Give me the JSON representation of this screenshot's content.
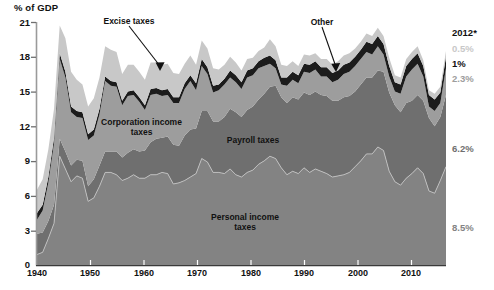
{
  "chart_data": {
    "type": "area",
    "title": "",
    "ylabel": "% of GDP",
    "xlabel": "",
    "xlim": [
      1940,
      2012
    ],
    "ylim": [
      0,
      21
    ],
    "yticks": [
      0,
      3,
      6,
      9,
      12,
      15,
      18,
      21
    ],
    "xticks": [
      1940,
      1950,
      1960,
      1970,
      1980,
      1990,
      2000,
      2010
    ],
    "grid": false,
    "legend": "inline-annotations",
    "stacked": true,
    "x": [
      1940,
      1941,
      1942,
      1943,
      1944,
      1945,
      1946,
      1947,
      1948,
      1949,
      1950,
      1951,
      1952,
      1953,
      1954,
      1955,
      1956,
      1957,
      1958,
      1959,
      1960,
      1961,
      1962,
      1963,
      1964,
      1965,
      1966,
      1967,
      1968,
      1969,
      1970,
      1971,
      1972,
      1973,
      1974,
      1975,
      1976,
      1977,
      1978,
      1979,
      1980,
      1981,
      1982,
      1983,
      1984,
      1985,
      1986,
      1987,
      1988,
      1989,
      1990,
      1991,
      1992,
      1993,
      1994,
      1995,
      1996,
      1997,
      1998,
      1999,
      2000,
      2001,
      2002,
      2003,
      2004,
      2005,
      2006,
      2007,
      2008,
      2009,
      2010,
      2011,
      2012
    ],
    "series": [
      {
        "name": "Personal income taxes",
        "label": "Personal income\ntaxes",
        "color": "#838383",
        "end_value": "8.5%",
        "values": [
          0.9,
          1.1,
          2.3,
          3.6,
          9.4,
          8.3,
          7.2,
          7.7,
          7.5,
          5.5,
          5.8,
          6.8,
          8.0,
          8.0,
          7.8,
          7.3,
          7.5,
          7.8,
          7.5,
          7.5,
          7.8,
          7.8,
          8.0,
          7.9,
          7.0,
          7.1,
          7.3,
          7.6,
          7.9,
          9.2,
          8.9,
          8.0,
          8.0,
          7.9,
          8.3,
          7.8,
          7.6,
          8.0,
          8.2,
          8.7,
          9.0,
          9.4,
          9.2,
          8.4,
          7.8,
          8.1,
          7.9,
          8.4,
          8.0,
          8.3,
          8.1,
          7.9,
          7.6,
          7.7,
          7.8,
          8.0,
          8.5,
          9.0,
          9.6,
          9.6,
          10.2,
          9.9,
          8.1,
          7.2,
          6.9,
          7.5,
          7.9,
          8.4,
          7.9,
          6.4,
          6.2,
          7.3,
          8.5
        ]
      },
      {
        "name": "Payroll taxes",
        "label": "Payroll taxes",
        "color": "#6f6f6f",
        "end_value": "6.2%",
        "values": [
          1.8,
          1.7,
          1.5,
          1.6,
          1.5,
          1.5,
          1.4,
          1.4,
          1.5,
          1.3,
          1.6,
          1.8,
          1.8,
          1.8,
          2.0,
          2.0,
          2.2,
          2.2,
          2.3,
          2.4,
          2.8,
          3.1,
          3.0,
          3.2,
          3.4,
          3.2,
          3.9,
          4.1,
          3.9,
          4.1,
          4.4,
          4.4,
          4.4,
          4.9,
          5.2,
          5.4,
          5.2,
          5.4,
          5.5,
          5.6,
          5.8,
          6.0,
          6.3,
          6.1,
          6.2,
          6.4,
          6.4,
          6.5,
          6.7,
          6.7,
          6.6,
          6.7,
          6.6,
          6.5,
          6.7,
          6.6,
          6.5,
          6.6,
          6.6,
          6.6,
          6.6,
          6.8,
          6.8,
          6.6,
          6.3,
          6.5,
          6.3,
          6.3,
          6.3,
          6.3,
          5.8,
          5.5,
          6.2
        ]
      },
      {
        "name": "Corporation income taxes",
        "label": "Corporation income\ntaxes",
        "color": "#9d9d9d",
        "end_value": "2.3%",
        "values": [
          1.2,
          1.9,
          3.3,
          5.3,
          6.9,
          6.4,
          4.6,
          3.7,
          3.7,
          4.0,
          3.8,
          4.4,
          6.1,
          5.7,
          5.6,
          4.5,
          4.9,
          4.7,
          4.3,
          3.5,
          4.1,
          3.9,
          3.6,
          3.6,
          3.6,
          3.7,
          4.0,
          4.2,
          3.3,
          3.9,
          3.2,
          2.5,
          2.7,
          2.8,
          2.7,
          2.6,
          2.4,
          2.8,
          2.7,
          2.7,
          2.4,
          2.0,
          1.5,
          1.1,
          1.5,
          1.5,
          1.4,
          1.8,
          1.9,
          1.9,
          1.6,
          1.7,
          1.6,
          1.8,
          2.0,
          2.1,
          2.2,
          2.2,
          2.2,
          2.0,
          2.1,
          1.5,
          1.4,
          1.2,
          1.6,
          2.3,
          2.7,
          2.7,
          2.1,
          1.0,
          1.3,
          1.2,
          2.3
        ]
      },
      {
        "name": "Other",
        "label": "Other",
        "color": "#1c1c1c",
        "end_value": "1%",
        "values": [
          0.6,
          0.5,
          0.5,
          0.5,
          0.5,
          0.5,
          0.5,
          0.5,
          0.5,
          0.5,
          0.5,
          0.5,
          0.4,
          0.4,
          0.4,
          0.4,
          0.4,
          0.4,
          0.4,
          0.4,
          0.5,
          0.5,
          0.5,
          0.5,
          0.5,
          0.5,
          0.5,
          0.5,
          0.6,
          0.6,
          0.6,
          0.6,
          0.5,
          0.5,
          0.6,
          0.6,
          0.6,
          0.6,
          0.6,
          0.6,
          0.7,
          0.7,
          0.7,
          0.6,
          0.7,
          0.7,
          0.7,
          0.7,
          0.7,
          0.7,
          0.8,
          0.8,
          0.8,
          0.8,
          0.8,
          0.8,
          0.8,
          0.8,
          0.9,
          0.9,
          0.9,
          0.9,
          0.9,
          0.8,
          0.8,
          0.9,
          0.9,
          0.9,
          0.9,
          1.0,
          1.0,
          0.9,
          1.0
        ]
      },
      {
        "name": "Excise taxes",
        "label": "Excise taxes",
        "color": "#c8c8c8",
        "end_value": "0.5%",
        "values": [
          2.0,
          2.2,
          2.4,
          2.5,
          2.4,
          2.9,
          3.0,
          2.7,
          2.4,
          2.4,
          2.7,
          2.7,
          2.6,
          2.7,
          2.6,
          2.3,
          2.3,
          2.2,
          2.2,
          2.2,
          2.3,
          2.2,
          2.2,
          2.2,
          2.1,
          2.0,
          1.7,
          1.7,
          1.6,
          1.6,
          1.6,
          1.5,
          1.3,
          1.2,
          1.2,
          1.1,
          1.0,
          1.0,
          0.9,
          0.9,
          0.9,
          1.4,
          1.2,
          1.1,
          1.0,
          0.9,
          0.8,
          0.8,
          0.8,
          0.7,
          0.7,
          0.7,
          0.7,
          0.8,
          0.8,
          0.8,
          0.7,
          0.7,
          0.7,
          0.7,
          0.7,
          0.7,
          0.7,
          0.6,
          0.6,
          0.6,
          0.6,
          0.6,
          0.5,
          0.4,
          0.5,
          0.5,
          0.5
        ]
      }
    ],
    "right_column": {
      "header": "2012*",
      "entries": [
        {
          "label": "0.5%",
          "color": "#c8c8c8",
          "series": "Excise taxes"
        },
        {
          "label": "1%",
          "color": "#1c1c1c",
          "series": "Other"
        },
        {
          "label": "2.3%",
          "color": "#9d9d9d",
          "series": "Corporation income taxes"
        },
        {
          "label": "6.2%",
          "color": "#6f6f6f",
          "series": "Payroll taxes"
        },
        {
          "label": "8.5%",
          "color": "#838383",
          "series": "Personal income taxes"
        }
      ]
    },
    "annotations": [
      {
        "name": "excise-taxes",
        "text": "Excise taxes",
        "leader": true
      },
      {
        "name": "other",
        "text": "Other",
        "leader": true
      },
      {
        "name": "corporation-income-taxes",
        "text": "Corporation income\ntaxes",
        "leader": false
      },
      {
        "name": "payroll-taxes",
        "text": "Payroll taxes",
        "leader": false
      },
      {
        "name": "personal-income-taxes",
        "text": "Personal income\ntaxes",
        "leader": false
      }
    ]
  },
  "axis": {
    "y_title": "% of GDP",
    "y_labels": [
      "21",
      "18",
      "15",
      "12",
      "9",
      "6",
      "3",
      "0"
    ],
    "x_labels": [
      "1940",
      "1950",
      "1960",
      "1970",
      "1980",
      "1990",
      "2000",
      "2010"
    ]
  },
  "labels": {
    "excise": "Excise taxes",
    "other": "Other",
    "corporation_l1": "Corporation income",
    "corporation_l2": "taxes",
    "payroll": "Payroll taxes",
    "personal_l1": "Personal income",
    "personal_l2": "taxes",
    "year_header": "2012*",
    "v_excise": "0.5%",
    "v_other": "1%",
    "v_corp": "2.3%",
    "v_payroll": "6.2%",
    "v_personal": "8.5%"
  }
}
